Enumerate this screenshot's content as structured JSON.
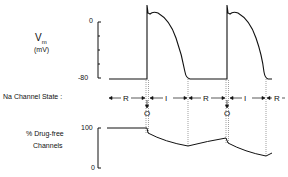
{
  "diagram": {
    "type": "cardiac action potential and sodium channel state diagram",
    "top_panel": {
      "ylabel": "V",
      "ylabel_sub": "m",
      "yunit": "(mV)",
      "ticks": [
        "0",
        "-80"
      ],
      "trace": "two action potentials with rapid upstroke, notch, plateau and repolarization"
    },
    "state_row": {
      "label": "Na Channel State :",
      "segments": [
        {
          "state": "R",
          "meaning": "resting"
        },
        {
          "state": "O",
          "meaning": "open"
        },
        {
          "state": "I",
          "meaning": "inactivated"
        },
        {
          "state": "R",
          "meaning": "resting"
        },
        {
          "state": "O",
          "meaning": "open"
        },
        {
          "state": "I",
          "meaning": "inactivated"
        },
        {
          "state": "R",
          "meaning": "resting"
        }
      ]
    },
    "bottom_panel": {
      "ylabel_line1": "% Drug-free",
      "ylabel_line2": "Channels",
      "ticks": [
        "100",
        "0"
      ],
      "trace": "stepwise decline during open/inactivated states, partial recovery during rest"
    }
  },
  "labels": {
    "vm": "V",
    "vm_sub": "m",
    "mv": "(mV)",
    "tick_0": "0",
    "tick_m80": "-80",
    "state_label": "Na Channel State :",
    "drug_line1": "% Drug-free",
    "drug_line2": "Channels",
    "tick_100": "100",
    "tick_0b": "0",
    "R": "R",
    "I": "I",
    "O": "O"
  },
  "colors": {
    "line": "#111111",
    "dotted": "#888888",
    "background": "#ffffff"
  }
}
